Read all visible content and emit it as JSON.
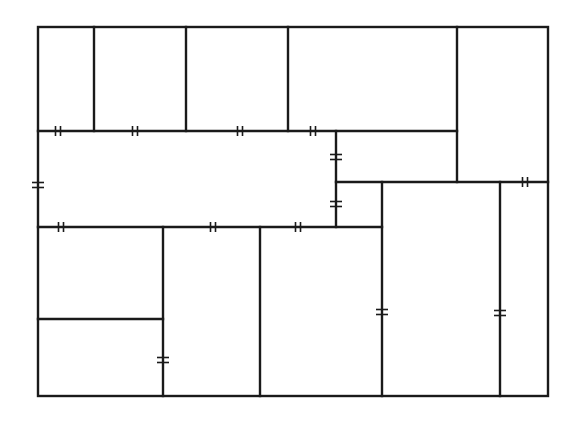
{
  "diagram": {
    "type": "floor-plan",
    "colors": {
      "wall": "#1a1a1a",
      "background": "#ffffff"
    },
    "outer": {
      "x1": 38,
      "y1": 27,
      "x2": 548,
      "y2": 396
    },
    "walls": [
      {
        "id": "v-top-1",
        "x1": 94,
        "y1": 27,
        "x2": 94,
        "y2": 131
      },
      {
        "id": "v-top-2",
        "x1": 186,
        "y1": 27,
        "x2": 186,
        "y2": 131
      },
      {
        "id": "v-top-3",
        "x1": 288,
        "y1": 27,
        "x2": 288,
        "y2": 131
      },
      {
        "id": "v-top-4",
        "x1": 457,
        "y1": 27,
        "x2": 457,
        "y2": 182
      },
      {
        "id": "h-131",
        "x1": 38,
        "y1": 131,
        "x2": 457,
        "y2": 131
      },
      {
        "id": "v-336",
        "x1": 336,
        "y1": 131,
        "x2": 336,
        "y2": 227
      },
      {
        "id": "h-182",
        "x1": 336,
        "y1": 182,
        "x2": 548,
        "y2": 182
      },
      {
        "id": "h-227",
        "x1": 38,
        "y1": 227,
        "x2": 382,
        "y2": 227
      },
      {
        "id": "v-382",
        "x1": 382,
        "y1": 182,
        "x2": 382,
        "y2": 396
      },
      {
        "id": "v-500",
        "x1": 500,
        "y1": 182,
        "x2": 500,
        "y2": 396
      },
      {
        "id": "v-163",
        "x1": 163,
        "y1": 227,
        "x2": 163,
        "y2": 396
      },
      {
        "id": "v-260",
        "x1": 260,
        "y1": 227,
        "x2": 260,
        "y2": 396
      },
      {
        "id": "h-319",
        "x1": 38,
        "y1": 319,
        "x2": 163,
        "y2": 319
      }
    ],
    "doors": [
      {
        "orient": "h",
        "x": 58,
        "y": 131
      },
      {
        "orient": "h",
        "x": 135,
        "y": 131
      },
      {
        "orient": "h",
        "x": 240,
        "y": 131
      },
      {
        "orient": "h",
        "x": 313,
        "y": 131
      },
      {
        "orient": "v",
        "x": 38,
        "y": 185
      },
      {
        "orient": "v",
        "x": 336,
        "y": 157
      },
      {
        "orient": "v",
        "x": 336,
        "y": 204
      },
      {
        "orient": "h",
        "x": 525,
        "y": 182
      },
      {
        "orient": "h",
        "x": 61,
        "y": 227
      },
      {
        "orient": "h",
        "x": 213,
        "y": 227
      },
      {
        "orient": "h",
        "x": 298,
        "y": 227
      },
      {
        "orient": "v",
        "x": 163,
        "y": 360
      },
      {
        "orient": "v",
        "x": 382,
        "y": 312
      },
      {
        "orient": "v",
        "x": 500,
        "y": 313
      }
    ]
  }
}
